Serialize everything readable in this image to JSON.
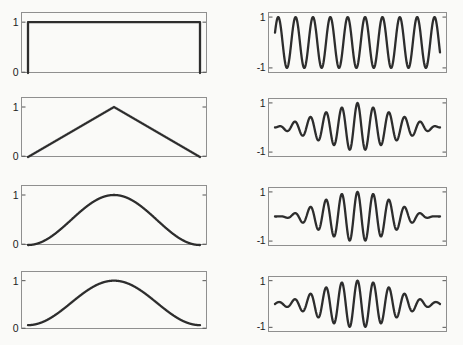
{
  "figure": {
    "background": "#fafaf8",
    "frame_color": "#8f8f8f",
    "tick_color": "#555555",
    "line_color": "#2d2d2d",
    "label_color": "#1c1c1c",
    "grid": "off",
    "layout": "4 rows x 2 columns; left column = window functions, right column = windowed sinusoids"
  },
  "chart_data": [
    {
      "name": "rectangular-window",
      "type": "line",
      "column": "left",
      "row": 1,
      "signal": "window",
      "window": "rectangular",
      "description": "Rectangular (boxcar) window, value 1 across full span with abrupt edges",
      "xlim": [
        0,
        1
      ],
      "ylim": [
        0,
        1.2
      ],
      "yticks": [
        {
          "value": 1,
          "label": "1"
        },
        {
          "value": 0,
          "label": "0"
        }
      ]
    },
    {
      "name": "sine-rectangular-windowed",
      "type": "line",
      "column": "right",
      "row": 1,
      "signal": "sine",
      "window": "rectangular",
      "cycles": 9.5,
      "phase": 0.4,
      "amplitude": 1,
      "description": "Constant-amplitude sinusoid (rectangular-windowed), about 10 peaks",
      "xlim": [
        0,
        1
      ],
      "ylim": [
        -1.2,
        1.2
      ],
      "yticks": [
        {
          "value": 1,
          "label": "1"
        },
        {
          "value": -1,
          "label": "-1"
        }
      ]
    },
    {
      "name": "triangular-window",
      "type": "line",
      "column": "left",
      "row": 2,
      "signal": "window",
      "window": "triangular",
      "description": "Triangular (Bartlett) window, linear rise to 1 at center then linear fall to 0",
      "xlim": [
        0,
        1
      ],
      "ylim": [
        0,
        1.2
      ],
      "yticks": [
        {
          "value": 1,
          "label": "1"
        },
        {
          "value": 0,
          "label": "0"
        }
      ]
    },
    {
      "name": "sine-triangular-windowed",
      "type": "line",
      "column": "right",
      "row": 2,
      "signal": "windowed_sine",
      "window": "triangular",
      "cycles": 10.5,
      "amplitude": 1,
      "description": "Sinusoid multiplied by triangular window; 11 positive peaks, tallest at center",
      "xlim": [
        0,
        1
      ],
      "ylim": [
        -1.2,
        1.2
      ],
      "yticks": [
        {
          "value": 1,
          "label": "1"
        },
        {
          "value": -1,
          "label": "-1"
        }
      ]
    },
    {
      "name": "hann-window",
      "type": "line",
      "column": "left",
      "row": 3,
      "signal": "window",
      "window": "hann",
      "description": "Hann (raised-cosine) window, smooth bell reaching 0 at both edges",
      "xlim": [
        0,
        1
      ],
      "ylim": [
        0,
        1.2
      ],
      "yticks": [
        {
          "value": 1,
          "label": "1"
        },
        {
          "value": 0,
          "label": "0"
        }
      ]
    },
    {
      "name": "sine-hann-windowed",
      "type": "line",
      "column": "right",
      "row": 3,
      "signal": "windowed_sine",
      "window": "hann",
      "cycles": 10.5,
      "amplitude": 1,
      "description": "Sinusoid multiplied by Hann window; smooth envelope tapering to zero at edges",
      "xlim": [
        0,
        1
      ],
      "ylim": [
        -1.2,
        1.2
      ],
      "yticks": [
        {
          "value": 1,
          "label": "1"
        },
        {
          "value": -1,
          "label": "-1"
        }
      ]
    },
    {
      "name": "hamming-window",
      "type": "line",
      "column": "left",
      "row": 4,
      "signal": "window",
      "window": "hamming",
      "description": "Hamming window, bell shape with edges raised to about 0.08",
      "xlim": [
        0,
        1
      ],
      "ylim": [
        0,
        1.2
      ],
      "yticks": [
        {
          "value": 1,
          "label": "1"
        },
        {
          "value": 0,
          "label": "0"
        }
      ]
    },
    {
      "name": "sine-hamming-windowed",
      "type": "line",
      "column": "right",
      "row": 4,
      "signal": "windowed_sine",
      "window": "hamming",
      "cycles": 10.5,
      "amplitude": 1,
      "description": "Sinusoid multiplied by Hamming window; envelope with small non-zero edge amplitude",
      "xlim": [
        0,
        1
      ],
      "ylim": [
        -1.2,
        1.2
      ],
      "yticks": [
        {
          "value": 1,
          "label": "1"
        },
        {
          "value": -1,
          "label": "-1"
        }
      ]
    }
  ]
}
